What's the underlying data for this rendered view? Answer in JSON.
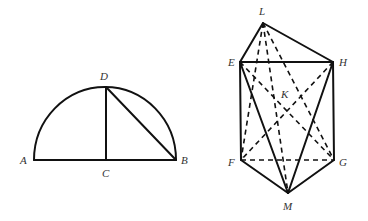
{
  "figures": [
    {
      "name": "semicircle",
      "points": {
        "A": {
          "label": "A",
          "x": 34,
          "y": 160
        },
        "B": {
          "label": "B",
          "x": 176,
          "y": 160
        },
        "C": {
          "label": "C",
          "x": 106,
          "y": 160
        },
        "D": {
          "label": "D",
          "x": 106,
          "y": 87
        }
      },
      "solid_segments": [
        [
          "A",
          "B"
        ],
        [
          "C",
          "D"
        ],
        [
          "D",
          "B"
        ]
      ],
      "arc": {
        "from": "A",
        "to": "B",
        "through": "D"
      }
    },
    {
      "name": "solid-figure",
      "points": {
        "L": {
          "label": "L",
          "x": 263,
          "y": 23
        },
        "E": {
          "label": "E",
          "x": 240,
          "y": 62
        },
        "H": {
          "label": "H",
          "x": 333,
          "y": 62
        },
        "F": {
          "label": "F",
          "x": 241,
          "y": 160
        },
        "G": {
          "label": "G",
          "x": 334,
          "y": 160
        },
        "M": {
          "label": "M",
          "x": 288,
          "y": 193
        },
        "K": {
          "label": "K",
          "x": 285,
          "y": 94
        }
      },
      "solid_segments": [
        [
          "L",
          "E"
        ],
        [
          "L",
          "H"
        ],
        [
          "E",
          "H"
        ],
        [
          "E",
          "F"
        ],
        [
          "H",
          "G"
        ],
        [
          "F",
          "M"
        ],
        [
          "G",
          "M"
        ],
        [
          "E",
          "M"
        ],
        [
          "H",
          "M"
        ]
      ],
      "dashed_segments": [
        [
          "F",
          "G"
        ],
        [
          "L",
          "F"
        ],
        [
          "L",
          "M"
        ],
        [
          "L",
          "G"
        ],
        [
          "E",
          "G"
        ],
        [
          "H",
          "F"
        ]
      ]
    }
  ],
  "labels": {
    "A": "A",
    "B": "B",
    "C": "C",
    "D": "D",
    "L": "L",
    "E": "E",
    "H": "H",
    "F": "F",
    "G": "G",
    "M": "M",
    "K": "K"
  }
}
